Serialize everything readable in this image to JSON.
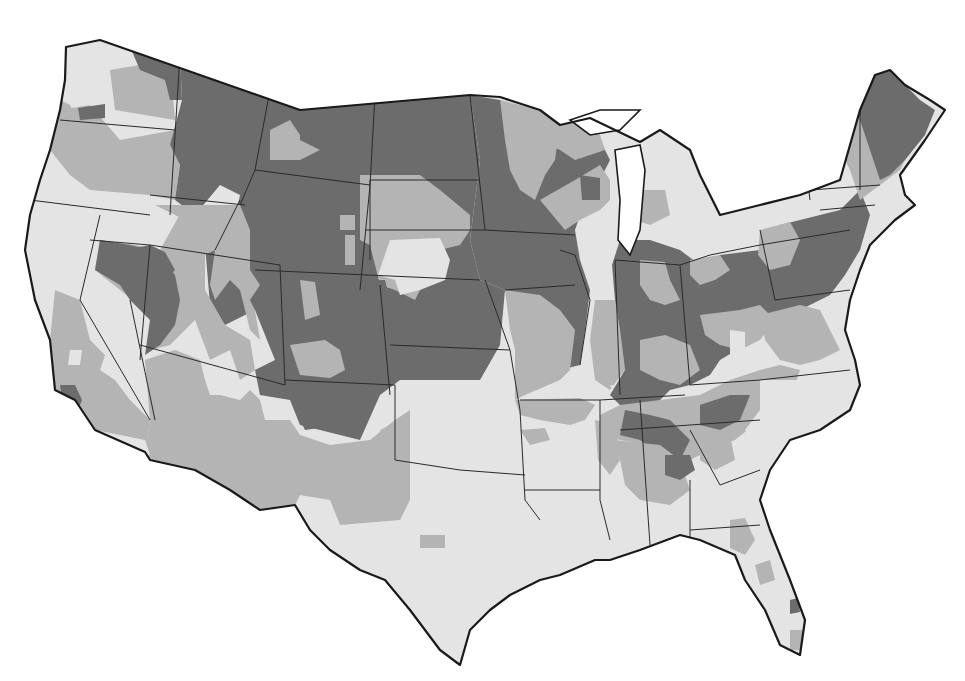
{
  "map": {
    "title": "",
    "legend": [],
    "shades": {
      "dark": "#6c6c6c",
      "medium": "#b4b4b4",
      "light": "#e4e4e4",
      "water": "#ffffff",
      "border": "#1a1a1a"
    },
    "outline": "M66,47 L100,40 L300,110 L470,95 L500,97 L540,110 L560,125 L590,118 L640,142 L660,130 L690,150 L700,175 L720,215 L760,205 L800,195 L840,180 L860,110 L875,75 L890,70 L905,85 L930,100 L945,110 L925,140 L900,175 L905,195 L915,205 L895,220 L870,245 L860,270 L850,300 L845,330 L855,360 L860,385 L850,410 L820,430 L790,440 L770,470 L760,500 L770,530 L790,580 L805,620 L800,655 L780,645 L765,610 L745,580 L735,555 L700,540 L680,535 L640,550 L610,560 L595,560 L560,575 L540,580 L510,595 L490,610 L470,630 L460,665 L440,650 L410,610 L385,580 L360,570 L330,550 L310,530 L295,505 L260,510 L230,490 L195,470 L150,460 L145,452 L95,430 L75,400 L55,390 L50,340 L35,300 L25,250 L30,215 L40,180 L50,150 L60,110 L65,80 Z",
    "base_fill": "light",
    "regions": [
      {
        "shade": "medium",
        "d": "M60,110 L90,105 L120,140 L175,130 L180,130 L170,145 L180,165 L175,200 L150,195 L90,190 L70,175 L50,150 Z"
      },
      {
        "shade": "medium",
        "d": "M60,100 L70,105 L75,115 L60,120 Z"
      },
      {
        "shade": "dark",
        "d": "M78,108 L105,104 L105,118 L80,120 Z"
      },
      {
        "shade": "medium",
        "d": "M110,70 L170,60 L175,120 L145,115 L115,110 Z"
      },
      {
        "shade": "dark",
        "d": "M128,42 L180,55 L182,100 L170,100 L165,80 L140,70 Z"
      },
      {
        "shade": "dark",
        "d": "M180,55 L470,95 L480,160 L470,240 L480,280 L505,290 L500,345 L480,380 L400,380 L380,395 L360,440 L300,425 L290,400 L260,395 L255,370 L275,360 L255,310 L225,325 L210,305 L205,245 L230,245 L240,195 L220,185 L195,215 L175,200 L180,165 L170,145 L182,100 Z"
      },
      {
        "shade": "medium",
        "d": "M270,130 L290,120 L300,135 L300,140 L320,150 L300,160 L270,160 Z"
      },
      {
        "shade": "medium",
        "d": "M360,175 L420,175 L440,190 L470,215 L470,230 L460,245 L440,250 L430,270 L415,300 L395,290 L380,285 L370,245 L360,240 Z"
      },
      {
        "shade": "light",
        "d": "M390,240 L440,238 L450,260 L445,280 L420,290 L400,295 L395,280 L378,275 Z"
      },
      {
        "shade": "medium",
        "d": "M345,235 L355,235 L355,265 L345,265 Z"
      },
      {
        "shade": "medium",
        "d": "M340,215 L355,215 L355,230 L340,230 Z"
      },
      {
        "shade": "medium",
        "d": "M185,205 L215,220 L215,250 L205,255 L205,290 L225,325 L250,340 L255,370 L240,380 L230,350 L210,360 L195,320 L170,345 L150,350 L150,315 L120,290 L95,270 L100,240 L135,245 L160,250 Z"
      },
      {
        "shade": "dark",
        "d": "M100,240 L130,245 L150,250 L160,255 L175,275 L180,300 L175,325 L160,345 L145,355 L150,320 L130,300 L120,285 L95,270 Z"
      },
      {
        "shade": "dark",
        "d": "M125,250 L150,245 L165,252 L175,270 L165,280 L140,270 Z"
      },
      {
        "shade": "medium",
        "d": "M155,205 L240,205 L250,230 L250,270 L260,285 L250,300 L255,310 L260,340 L250,330 L240,290 L230,280 L215,300 L210,285 L215,250 L195,225 Z"
      },
      {
        "shade": "dark",
        "d": "M280,265 L290,270 L300,290 L300,320 L285,330 L285,365 L290,380 L330,380 L350,365 L380,380 L390,300 L385,280 L360,280 L355,270 L310,265 Z"
      },
      {
        "shade": "medium",
        "d": "M300,280 L315,282 L320,315 L305,320 Z"
      },
      {
        "shade": "medium",
        "d": "M290,345 L325,340 L340,350 L345,370 L330,378 L300,375 Z"
      },
      {
        "shade": "medium",
        "d": "M145,360 L175,350 L200,360 L205,380 L210,395 L220,395 L240,400 L250,390 L260,400 L265,420 L290,420 L300,435 L330,445 L370,440 L395,420 L410,410 L410,500 L400,520 L340,525 L330,500 L300,495 L295,505 L260,510 L230,490 L195,470 L150,460 L145,452 L150,420 Z"
      },
      {
        "shade": "dark",
        "d": "M285,385 L340,380 L350,395 L355,420 L340,425 L305,430 L295,410 Z"
      },
      {
        "shade": "medium",
        "d": "M55,290 L80,300 L90,340 L105,355 L100,370 L115,380 L130,400 L150,420 L145,452 L95,430 L75,400 L55,390 L50,340 Z"
      },
      {
        "shade": "dark",
        "d": "M60,385 L75,385 L82,400 L78,410 L62,398 Z"
      },
      {
        "shade": "light",
        "d": "M95,430 L145,440 L150,455 L100,450 Z"
      },
      {
        "shade": "light",
        "d": "M70,350 L82,350 L80,365 L68,365 Z"
      },
      {
        "shade": "dark",
        "d": "M500,100 L560,125 L590,118 L600,140 L610,160 L600,180 L585,200 L575,230 L580,260 L590,290 L585,330 L580,365 L560,370 L540,345 L515,310 L505,290 L480,280 L470,240 L480,160 L470,95 Z"
      },
      {
        "shade": "medium",
        "d": "M500,100 L540,110 L560,125 L555,160 L545,175 L535,200 L520,190 L510,170 L505,140 Z"
      },
      {
        "shade": "medium",
        "d": "M540,200 L575,180 L600,165 L610,180 L610,200 L600,210 L580,220 L565,230 Z"
      },
      {
        "shade": "dark",
        "d": "M580,175 L600,178 L600,200 L582,200 Z"
      },
      {
        "shade": "medium",
        "d": "M505,290 L540,295 L560,310 L575,330 L570,370 L560,380 L525,395 L515,400 L515,350 L510,330 Z"
      },
      {
        "shade": "medium",
        "d": "M595,300 L615,300 L620,330 L625,370 L610,390 L595,380 L590,340 Z"
      },
      {
        "shade": "light",
        "d": "M610,385 L640,390 L635,405 L620,405 Z"
      },
      {
        "shade": "dark",
        "d": "M620,240 L650,240 L680,250 L700,265 L720,255 L760,250 L780,225 L800,220 L840,210 L860,190 L870,215 L860,250 L845,275 L830,295 L800,310 L770,330 L745,345 L720,360 L710,375 L690,385 L670,390 L660,400 L640,410 L620,405 L610,395 L625,370 L620,330 L615,300 L612,265 Z"
      },
      {
        "shade": "medium",
        "d": "M640,260 L665,262 L670,280 L680,300 L665,305 L650,300 L640,285 Z"
      },
      {
        "shade": "medium",
        "d": "M690,260 L720,255 L730,270 L715,280 L700,285 L690,275 Z"
      },
      {
        "shade": "medium",
        "d": "M760,230 L790,222 L800,240 L790,265 L770,270 L758,255 Z"
      },
      {
        "shade": "medium",
        "d": "M700,315 L740,310 L760,305 L775,320 L760,340 L740,350 L720,345 L705,335 Z"
      },
      {
        "shade": "medium",
        "d": "M640,340 L665,335 L690,345 L700,370 L680,385 L660,380 L640,370 Z"
      },
      {
        "shade": "light",
        "d": "M730,330 L745,332 L745,355 L730,355 Z"
      },
      {
        "shade": "medium",
        "d": "M760,315 L800,305 L820,310 L830,330 L840,350 L820,360 L800,365 L780,360 L765,340 Z"
      },
      {
        "shade": "light",
        "d": "M830,300 L845,300 L850,330 L840,340 Z"
      },
      {
        "shade": "medium",
        "d": "M620,405 L660,400 L700,395 L730,380 L760,370 L780,365 L800,370 L790,400 L760,420 L735,440 L710,450 L690,460 L670,450 L650,445 L620,440 L600,435 L600,415 Z"
      },
      {
        "shade": "dark",
        "d": "M625,410 L650,415 L670,420 L690,440 L680,460 L660,455 L640,440 L620,435 Z"
      },
      {
        "shade": "dark",
        "d": "M700,405 L730,395 L750,395 L740,420 L720,430 L700,425 Z"
      },
      {
        "shade": "light",
        "d": "M760,380 L830,380 L850,390 L840,410 L820,430 L790,440 L770,465 L760,450 L745,430 L760,410 Z"
      },
      {
        "shade": "medium",
        "d": "M615,440 L660,445 L680,460 L690,490 L670,505 L640,500 L625,485 L620,460 Z"
      },
      {
        "shade": "dark",
        "d": "M665,455 L690,455 L695,470 L680,480 L665,475 Z"
      },
      {
        "shade": "medium",
        "d": "M700,440 L730,435 L735,460 L715,470 L700,460 Z"
      },
      {
        "shade": "medium",
        "d": "M730,520 L745,518 L755,540 L745,555 L730,548 Z"
      },
      {
        "shade": "medium",
        "d": "M755,565 L770,560 L775,580 L760,585 Z"
      },
      {
        "shade": "dark",
        "d": "M790,600 L798,598 L800,612 L790,614 Z"
      },
      {
        "shade": "medium",
        "d": "M790,630 L805,630 L805,650 L790,650 Z"
      },
      {
        "shade": "medium",
        "d": "M520,430 L545,428 L550,440 L530,445 Z"
      },
      {
        "shade": "medium",
        "d": "M420,535 L445,535 L445,548 L420,548 Z"
      },
      {
        "shade": "medium",
        "d": "M515,400 L580,398 L595,405 L585,420 L570,425 L540,420 L520,415 Z"
      },
      {
        "shade": "medium",
        "d": "M595,420 L615,425 L620,460 L610,475 L598,460 Z"
      },
      {
        "shade": "medium",
        "d": "M380,430 L400,420 L410,430 L410,470 L395,470 Z"
      },
      {
        "shade": "medium",
        "d": "M840,75 L880,75 L910,110 L920,130 L900,170 L880,185 L860,200 L850,170 L840,150 L830,120 Z"
      },
      {
        "shade": "dark",
        "d": "M855,75 L890,70 L920,100 L935,110 L925,135 L905,160 L890,175 L880,180 L870,150 L860,120 Z"
      },
      {
        "shade": "light",
        "d": "M820,150 L840,150 L845,180 L830,190 L820,175 Z"
      },
      {
        "shade": "light",
        "d": "M620,145 L650,150 L660,175 L670,200 L655,225 L640,240 L625,235 L625,200 L620,170 Z"
      },
      {
        "shade": "medium",
        "d": "M640,190 L665,190 L670,215 L650,225 L635,220 Z"
      },
      {
        "shade": "medium",
        "d": "M530,125 L570,118 L600,135 L605,150 L575,160 L560,150 L540,140 Z"
      },
      {
        "shade": "light",
        "d": "M720,190 L740,200 L760,210 L750,230 L730,230 L715,215 Z"
      }
    ],
    "states": [
      "M180,55 L170,215",
      "M60,120 L175,130",
      "M150,195 L245,205",
      "M30,200 L150,215",
      "M100,215 L80,300 L150,420",
      "M90,240 L150,245",
      "M150,245 L140,360",
      "M130,300 L155,420",
      "M140,345 L285,385",
      "M150,245 L280,265",
      "M215,250 L240,200",
      "M240,205 L255,170 L370,185 L360,290",
      "M255,170 L270,90",
      "M370,185 L375,95",
      "M280,265 L285,385",
      "M285,380 L395,385",
      "M255,270 L480,280",
      "M370,260 L370,180",
      "M370,180 L480,180",
      "M375,95 L470,95",
      "M470,95 L485,230",
      "M365,230 L485,230",
      "M380,285 L390,395",
      "M390,345 L510,350",
      "M485,230 L575,235",
      "M485,280 L510,350",
      "M505,290 L575,285",
      "M510,350 L520,410",
      "M395,385 L395,460 L460,470 L525,475",
      "M520,400 L600,400",
      "M520,410 L525,500 L540,520",
      "M525,490 L600,490",
      "M600,400 L600,500 L610,540",
      "M600,400 L685,395",
      "M640,400 L650,545",
      "M560,250 L575,255 L590,300 L580,365",
      "M615,260 L620,395",
      "M615,260 L680,265 L690,385",
      "M680,265 L710,255 L760,245",
      "M760,230 L775,300",
      "M760,245 L850,230",
      "M775,300 L850,290",
      "M690,385 L760,380 L850,370",
      "M620,430 L760,420",
      "M690,430 L720,485",
      "M720,485 L760,470",
      "M690,480 L690,545",
      "M690,530 L760,525",
      "M800,120 L810,200",
      "M835,95 L840,180",
      "M860,110 L860,190",
      "M810,190 L880,185",
      "M820,210 L875,205"
    ],
    "lakes": [
      "M615,150 L640,145 L645,170 L640,230 L630,255 L618,240 L620,200 Z",
      "M570,120 L600,110 L640,110 L620,130 L590,135 Z"
    ]
  }
}
